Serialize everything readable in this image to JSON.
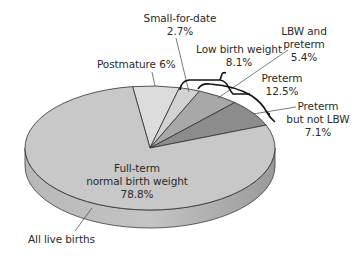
{
  "chart_data": {
    "type": "pie",
    "style": "3d-exploded-brackets",
    "title": "",
    "base_label": "All live births",
    "slices": [
      {
        "name": "Full-term normal birth weight",
        "value": 78.8,
        "color": "#c8c8c8"
      },
      {
        "name": "Postmature",
        "value": 6.0,
        "color": "#dcdcdc"
      },
      {
        "name": "Small-for-date",
        "value": 2.7,
        "color": "#d2d2d2"
      },
      {
        "name": "LBW and preterm",
        "value": 5.4,
        "color": "#a8a8a8"
      },
      {
        "name": "Preterm but not LBW",
        "value": 7.1,
        "color": "#8c8c8c"
      }
    ],
    "groupings": [
      {
        "name": "Low birth weight",
        "value": 8.1,
        "members": [
          "Small-for-date",
          "LBW and preterm"
        ]
      },
      {
        "name": "Preterm",
        "value": 12.5,
        "members": [
          "LBW and preterm",
          "Preterm but not LBW"
        ]
      }
    ]
  },
  "labels": {
    "fullterm": {
      "line1": "Full-term",
      "line2": "normal birth weight",
      "line3": "78.8%"
    },
    "postmature": {
      "line1": "Postmature 6%"
    },
    "sfd": {
      "line1": "Small-for-date",
      "line2": "2.7%"
    },
    "lbw": {
      "line1": "Low birth weight",
      "line2": "8.1%"
    },
    "lbwpre": {
      "line1": "LBW and",
      "line2": "preterm",
      "line3": "5.4%"
    },
    "preterm": {
      "line1": "Preterm",
      "line2": "12.5%"
    },
    "pnlbw": {
      "line1": "Preterm",
      "line2": "but not LBW",
      "line3": "7.1%"
    },
    "all": {
      "line1": "All live births"
    }
  }
}
